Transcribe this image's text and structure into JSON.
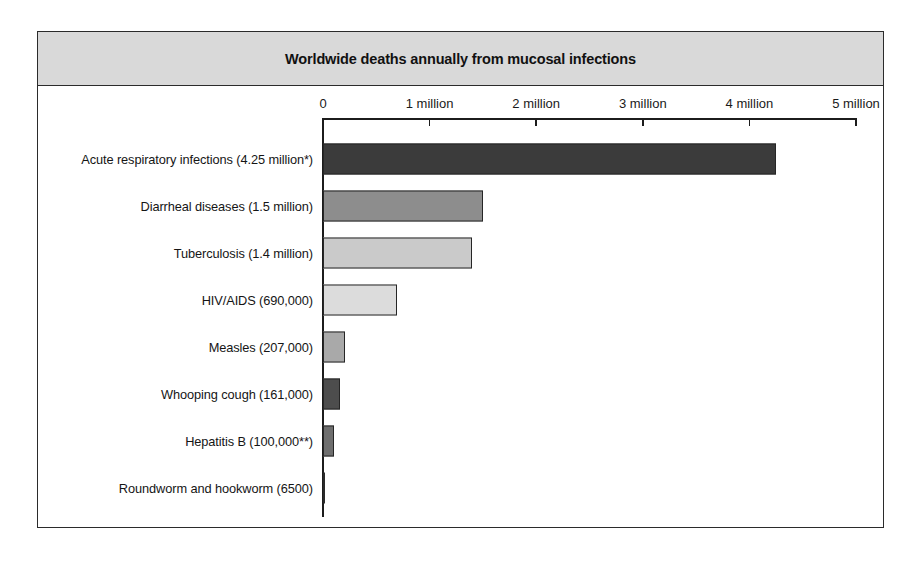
{
  "chart_data": {
    "type": "bar",
    "orientation": "horizontal",
    "title": "Worldwide deaths annually from mucosal infections",
    "xlabel": "",
    "ylabel": "",
    "xlim": [
      0,
      5000000
    ],
    "grid": false,
    "legend": null,
    "axis": {
      "tick_values": [
        0,
        1000000,
        2000000,
        3000000,
        4000000,
        5000000
      ],
      "tick_labels": [
        "0",
        "1 million",
        "2 million",
        "3 million",
        "4 million",
        "5 million"
      ]
    },
    "categories": [
      "Acute respiratory infections (4.25 million*)",
      "Diarrheal diseases (1.5 million)",
      "Tuberculosis (1.4 million)",
      "HIV/AIDS (690,000)",
      "Measles (207,000)",
      "Whooping cough (161,000)",
      "Hepatitis B (100,000**)",
      "Roundworm and hookworm (6500)"
    ],
    "values": [
      4250000,
      1500000,
      1400000,
      690000,
      207000,
      161000,
      100000,
      6500
    ],
    "value_labels": [
      "4.25 million*",
      "1.5 million",
      "1.4 million",
      "690,000",
      "207,000",
      "161,000",
      "100,000**",
      "6500"
    ],
    "bar_colors": [
      "#3b3b3b",
      "#8d8d8d",
      "#cacaca",
      "#dcdcdc",
      "#a9a9a9",
      "#4d4d4d",
      "#6e6e6e",
      "#2a2a2a"
    ]
  },
  "colors": {
    "title_band_background": "#d9d9d9",
    "frame_border": "#2b2b2b",
    "axis": "#1c1c1c",
    "plot_background": "#ffffff",
    "text": "#151515"
  }
}
